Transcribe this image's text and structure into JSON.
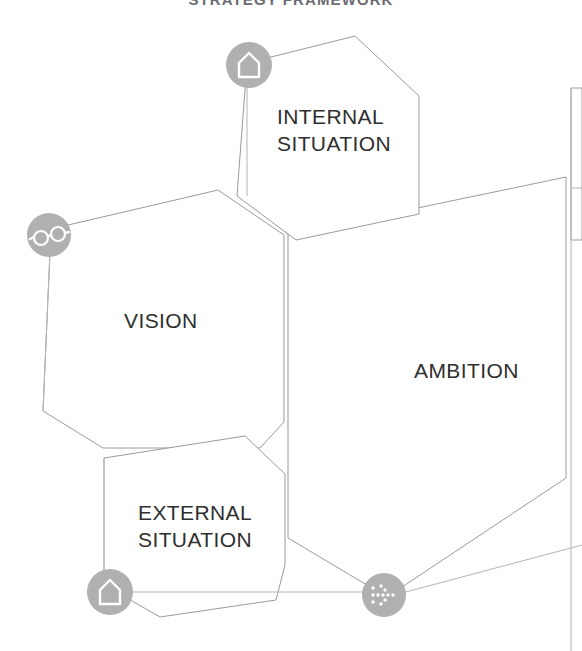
{
  "header": {
    "title": "STRATEGY FRAMEWORK"
  },
  "diagram": {
    "type": "strategy-framework",
    "background_color": "#ffffff",
    "shape_fill": "#ffffff",
    "shape_outline_color": "#9a9a9a",
    "node_circle_color": "#b0b0b0",
    "label_color": "#2f2f2f",
    "title_color": "#6b6b72",
    "blocks": [
      {
        "id": "internal-situation",
        "label": "INTERNAL\nSITUATION",
        "icon": "house-icon",
        "position": "top-center"
      },
      {
        "id": "vision",
        "label": "VISION",
        "icon": "glasses-icon",
        "position": "left"
      },
      {
        "id": "ambition",
        "label": "AMBITION",
        "icon": "dotted-arrow-icon",
        "position": "right"
      },
      {
        "id": "external-situation",
        "label": "EXTERNAL\nSITUATION",
        "icon": "house-icon",
        "position": "bottom-left"
      }
    ]
  }
}
